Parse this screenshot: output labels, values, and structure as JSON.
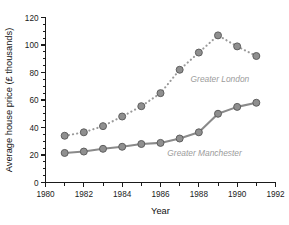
{
  "chart_data": {
    "type": "line",
    "title": "",
    "xlabel": "Year",
    "ylabel": "Average house price (£ thousands)",
    "xlim": [
      1980,
      1992
    ],
    "ylim": [
      0,
      120
    ],
    "x_ticks": [
      1980,
      1982,
      1984,
      1986,
      1988,
      1990,
      1992
    ],
    "x_tick_labels": [
      "1980",
      "1982",
      "1984",
      "1986",
      "1988",
      "1990",
      "1992"
    ],
    "x_minor_ticks": [
      1981,
      1983,
      1985,
      1987,
      1989,
      1991
    ],
    "y_ticks": [
      0,
      20,
      40,
      60,
      80,
      100,
      120
    ],
    "y_tick_labels": [
      "0",
      "20",
      "40",
      "60",
      "80",
      "100",
      "120"
    ],
    "y_minor_interval": 5,
    "grid": false,
    "legend_position": "inline-annotations",
    "x": [
      1981,
      1982,
      1983,
      1984,
      1985,
      1986,
      1987,
      1988,
      1989,
      1990,
      1991
    ],
    "series": [
      {
        "name": "Greater London",
        "line_style": "dotted",
        "color": "#9a9a9a",
        "marker": "circle",
        "values": [
          34,
          36.5,
          41,
          48,
          55.5,
          65,
          82,
          94.5,
          107,
          99,
          92
        ],
        "label_x": 1989.1,
        "label_y": 73
      },
      {
        "name": "Greater Manchester",
        "line_style": "solid",
        "color": "#8a8a8a",
        "marker": "circle",
        "values": [
          21.5,
          22.5,
          24.5,
          26,
          28,
          28.8,
          32,
          36.5,
          50,
          55,
          58
        ],
        "label_x": 1988.3,
        "label_y": 19.5
      }
    ]
  },
  "annotations": {
    "london_label": "Greater London",
    "manchester_label": "Greater Manchester"
  },
  "colors": {
    "axis": "#1a1a1a",
    "london_series": "#9a9a9a",
    "manchester_series": "#8a8a8a",
    "marker_fill": "#8f8f8f",
    "marker_stroke": "#5e5e5e",
    "annotation_text": "#9b9b9b",
    "background": "#ffffff"
  }
}
